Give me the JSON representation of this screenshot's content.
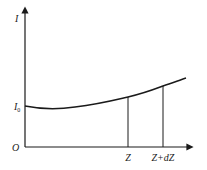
{
  "diagram": {
    "y_axis_label": "I",
    "x_axis_origin_label": "O",
    "intercept_label": "I",
    "intercept_subscript": "0",
    "marker_1_label": "Z",
    "marker_2_label": "Z+dZ",
    "line_color": "#1a1a1a"
  }
}
